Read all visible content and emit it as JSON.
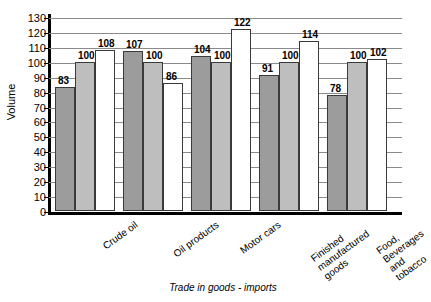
{
  "chart_data": {
    "type": "bar",
    "title": "",
    "xlabel": "Trade in goods - imports",
    "ylabel": "Volume",
    "ylim": [
      0,
      130
    ],
    "ytick_step": 10,
    "yticks": [
      0,
      10,
      20,
      30,
      40,
      50,
      60,
      70,
      80,
      90,
      100,
      110,
      120,
      130
    ],
    "grid": true,
    "legend": "none",
    "categories": [
      "Crude oil",
      "Oil products",
      "Motor cars",
      "Finished\nmanufactured\ngoods",
      "Food,\nBeverages\nand tobacco"
    ],
    "series": [
      {
        "name": "series-1",
        "style": "dark",
        "values": [
          83,
          107,
          104,
          91,
          78
        ]
      },
      {
        "name": "series-2",
        "style": "light",
        "values": [
          100,
          100,
          100,
          100,
          100
        ]
      },
      {
        "name": "series-3",
        "style": "white",
        "values": [
          108,
          86,
          122,
          114,
          102
        ]
      }
    ],
    "colors": {
      "dark": "#9c9c9c",
      "light": "#bebebe",
      "white": "#ffffff",
      "gridline": "#8a8a8a",
      "axis": "#000000"
    }
  }
}
